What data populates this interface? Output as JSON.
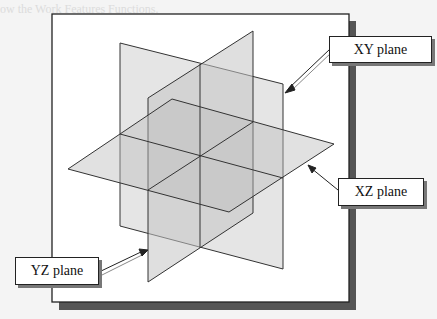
{
  "page": {
    "faded_heading": "ow the Work Features Functions."
  },
  "diagram": {
    "labels": {
      "xy": "XY plane",
      "xz": "XZ plane",
      "yz": "YZ plane"
    },
    "colors": {
      "frame_border": "#222222",
      "frame_shadow": "#555555",
      "plane_fill": "#c8c8c8",
      "plane_stroke": "#333333",
      "background": "#ffffff"
    }
  }
}
